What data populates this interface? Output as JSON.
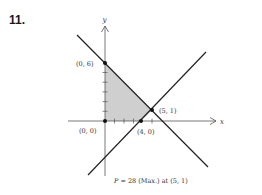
{
  "problem": {
    "number": "11."
  },
  "axes": {
    "x_label": "x",
    "y_label": "y"
  },
  "points": [
    {
      "label": "(0, 6)",
      "x": 0,
      "y": 6
    },
    {
      "label": "(0, 0)",
      "x": 0,
      "y": 0
    },
    {
      "label": "(4, 0)",
      "x": 4,
      "y": 0
    },
    {
      "label": "(5, 1)",
      "x": 5,
      "y": 1
    }
  ],
  "lines": [
    {
      "name": "x + y = 6"
    },
    {
      "name": "x - y = 4"
    }
  ],
  "feasible_region": {
    "vertices": [
      "(0, 0)",
      "(0, 6)",
      "(5, 1)",
      "(4, 0)"
    ],
    "fill": "#cfcfcf"
  },
  "caption": {
    "p_var": "P",
    "text": " = 28 (Max.) at (5, 1)"
  },
  "colors": {
    "line": "#222222",
    "axis": "#555555",
    "shade": "#cfcfcf"
  }
}
